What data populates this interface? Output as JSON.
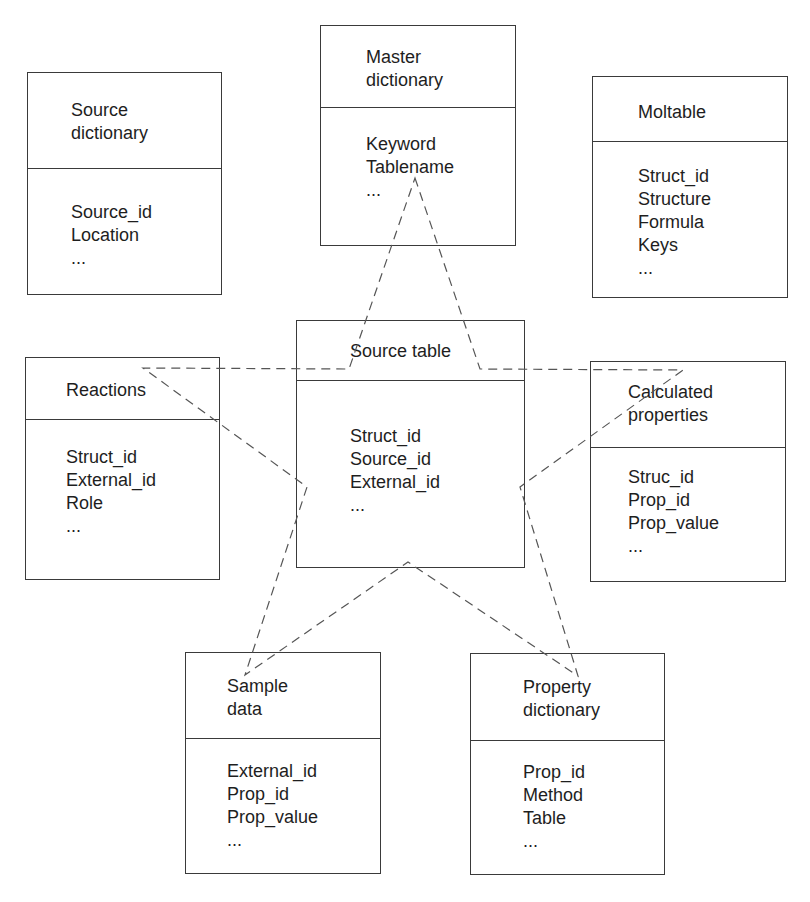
{
  "tables": {
    "source_dictionary": {
      "title": "Source\ndictionary",
      "fields": [
        "Source_id",
        "Location",
        "..."
      ]
    },
    "master_dictionary": {
      "title": "Master\ndictionary",
      "fields": [
        "Keyword",
        "Tablename",
        "..."
      ]
    },
    "moltable": {
      "title": "Moltable",
      "fields": [
        "Struct_id",
        "Structure",
        "Formula",
        "Keys",
        "..."
      ]
    },
    "reactions": {
      "title": "Reactions",
      "fields": [
        "Struct_id",
        "External_id",
        "Role",
        "..."
      ]
    },
    "source_table": {
      "title": "Source table",
      "fields": [
        "Struct_id",
        "Source_id",
        "External_id",
        "..."
      ]
    },
    "calculated_properties": {
      "title": "Calculated\nproperties",
      "fields": [
        "Struc_id",
        "Prop_id",
        "Prop_value",
        "..."
      ]
    },
    "sample_data": {
      "title": "Sample\ndata",
      "fields": [
        "External_id",
        "Prop_id",
        "Prop_value",
        "..."
      ]
    },
    "property_dictionary": {
      "title": "Property\ndictionary",
      "fields": [
        "Prop_id",
        "Method",
        "Table",
        "..."
      ]
    }
  },
  "connector": {
    "style": "dashed",
    "shape": "five-pointed star",
    "color": "#555555",
    "points_to": [
      "master_dictionary",
      "calculated_properties",
      "property_dictionary",
      "sample_data",
      "reactions"
    ]
  }
}
